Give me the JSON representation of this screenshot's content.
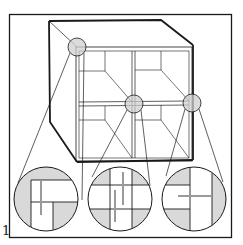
{
  "figure": {
    "label": "1",
    "colors": {
      "line": "#1a1a1a",
      "highlight": "#d9d9d9",
      "ghost": "#9a9a9a",
      "background": "#ffffff"
    }
  },
  "callouts": [
    {
      "id": "top-left-corner",
      "source": [
        77,
        47
      ],
      "detail": [
        46,
        199
      ]
    },
    {
      "id": "center-cross",
      "source": [
        134,
        104
      ],
      "detail": [
        120,
        199
      ]
    },
    {
      "id": "right-tee",
      "source": [
        192,
        103
      ],
      "detail": [
        194,
        199
      ]
    }
  ]
}
